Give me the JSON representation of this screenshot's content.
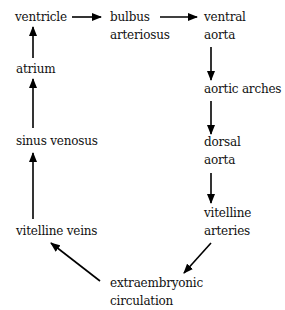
{
  "diagram": {
    "title": "",
    "colors": {
      "text": "#111111",
      "arrow": "#000000",
      "background": "#ffffff"
    },
    "nodes": {
      "ventricle": {
        "lines": [
          "ventricle"
        ]
      },
      "bulbus_arteriosus": {
        "lines": [
          "bulbus",
          "arteriosus"
        ]
      },
      "ventral_aorta": {
        "lines": [
          "ventral",
          "aorta"
        ]
      },
      "aortic_arches": {
        "lines": [
          "aortic arches"
        ]
      },
      "dorsal_aorta": {
        "lines": [
          "dorsal",
          "aorta"
        ]
      },
      "vitelline_arteries": {
        "lines": [
          "vitelline",
          "arteries"
        ]
      },
      "extraembryonic_circulation": {
        "lines": [
          "extraembryonic",
          "circulation"
        ]
      },
      "vitelline_veins": {
        "lines": [
          "vitelline veins"
        ]
      },
      "sinus_venosus": {
        "lines": [
          "sinus venosus"
        ]
      },
      "atrium": {
        "lines": [
          "atrium"
        ]
      }
    },
    "edges": [
      {
        "from": "ventricle",
        "to": "bulbus arteriosus"
      },
      {
        "from": "bulbus arteriosus",
        "to": "ventral aorta"
      },
      {
        "from": "ventral aorta",
        "to": "aortic arches"
      },
      {
        "from": "aortic arches",
        "to": "dorsal aorta"
      },
      {
        "from": "dorsal aorta",
        "to": "vitelline arteries"
      },
      {
        "from": "vitelline arteries",
        "to": "extraembryonic circulation"
      },
      {
        "from": "extraembryonic circulation",
        "to": "vitelline veins"
      },
      {
        "from": "vitelline veins",
        "to": "sinus venosus"
      },
      {
        "from": "sinus venosus",
        "to": "atrium"
      },
      {
        "from": "atrium",
        "to": "ventricle"
      }
    ]
  }
}
